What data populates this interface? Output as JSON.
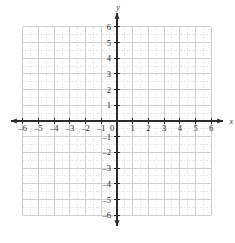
{
  "chart_data": {
    "type": "scatter",
    "title": "",
    "subtitle": "",
    "xlabel": "x",
    "ylabel": "y",
    "xlim": [
      -6,
      6
    ],
    "ylim": [
      -6,
      6
    ],
    "x_ticks": [
      -6,
      -5,
      -4,
      -3,
      -2,
      -1,
      0,
      1,
      2,
      3,
      4,
      5,
      6
    ],
    "y_ticks": [
      -6,
      -5,
      -4,
      -3,
      -2,
      -1,
      1,
      2,
      3,
      4,
      5,
      6
    ],
    "x_tick_labels": [
      "–6",
      "–5",
      "–4",
      "–3",
      "–2",
      "–1",
      "0",
      "1",
      "2",
      "3",
      "4",
      "5",
      "6"
    ],
    "y_tick_labels": [
      "–6",
      "–5",
      "–4",
      "–3",
      "–2",
      "–1",
      "1",
      "2",
      "3",
      "4",
      "5",
      "6"
    ],
    "origin_label": "0",
    "grid": true,
    "grid_major_step": 1,
    "grid_minor_step": 0.5,
    "legend": null,
    "series": [],
    "annotations": [],
    "axis_arrows": [
      "left",
      "right",
      "up",
      "down"
    ]
  },
  "style": {
    "background": "#ffffff",
    "grid_major_color": "#cfcfcf",
    "grid_minor_color": "#e2e2e2",
    "axis_color": "#2b2b2b",
    "label_color": "#2b2b2b"
  },
  "labels": {
    "x_axis_name": "x",
    "y_axis_name": "y"
  }
}
